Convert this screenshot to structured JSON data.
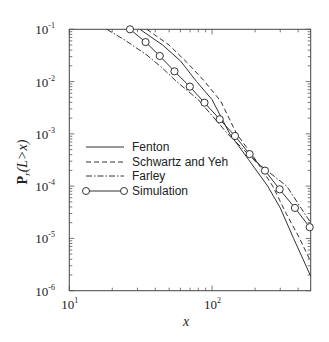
{
  "chart_data": {
    "type": "line",
    "title": "",
    "xlabel": "x",
    "ylabel": "P_r(L>x)",
    "xscale": "log",
    "yscale": "log",
    "xlim": [
      10,
      490
    ],
    "ylim": [
      1e-06,
      0.1
    ],
    "grid": false,
    "legend_position": "center-left",
    "x_tick_labels": [
      {
        "value": 10,
        "base": "10",
        "exp": "1"
      },
      {
        "value": 100,
        "base": "10",
        "exp": "2"
      }
    ],
    "y_tick_labels": [
      {
        "value": 0.1,
        "base": "10",
        "exp": "-1"
      },
      {
        "value": 0.01,
        "base": "10",
        "exp": "-2"
      },
      {
        "value": 0.001,
        "base": "10",
        "exp": "-3"
      },
      {
        "value": 0.0001,
        "base": "10",
        "exp": "-4"
      },
      {
        "value": 1e-05,
        "base": "10",
        "exp": "-5"
      },
      {
        "value": 1e-06,
        "base": "10",
        "exp": "-6"
      }
    ],
    "series": [
      {
        "name": "Fenton",
        "style": "solid",
        "markers": false,
        "x": [
          31.2,
          45,
          60,
          77.8,
          100,
          133,
          180,
          245,
          300,
          372,
          490
        ],
        "y": [
          0.1,
          0.05,
          0.025,
          0.01,
          0.0045,
          0.001,
          0.00032,
          0.0001,
          3.8e-05,
          1e-05,
          1.9e-06
        ]
      },
      {
        "name": "Schwartz and Yeh",
        "style": "dashed",
        "markers": false,
        "x": [
          34.9,
          50,
          68,
          88.9,
          115,
          148.6,
          200,
          265.5,
          330,
          410,
          490
        ],
        "y": [
          0.1,
          0.05,
          0.022,
          0.01,
          0.0042,
          0.001,
          0.00033,
          0.0001,
          3e-05,
          1e-05,
          3.6e-06
        ]
      },
      {
        "name": "Farley",
        "style": "dashdot",
        "markers": false,
        "x": [
          18.3,
          25,
          35,
          45,
          56.4,
          80,
          128.8,
          200,
          332.6,
          420,
          490
        ],
        "y": [
          0.1,
          0.06,
          0.032,
          0.018,
          0.01,
          0.0045,
          0.001,
          0.0003,
          0.0001,
          3.8e-05,
          2e-05
        ]
      },
      {
        "name": "Simulation",
        "style": "solid",
        "markers": true,
        "marker": "open-circle",
        "x": [
          26.6,
          34.2,
          43.0,
          54.5,
          69.8,
          88.4,
          113,
          144.5,
          183,
          234.5,
          297,
          380,
          482
        ],
        "y": [
          0.1,
          0.057,
          0.0309,
          0.0157,
          0.008,
          0.00395,
          0.0019,
          0.00091,
          0.00041,
          0.000198,
          8.7e-05,
          3.83e-05,
          1.64e-05
        ]
      }
    ]
  },
  "legend": {
    "items": [
      {
        "label": "Fenton"
      },
      {
        "label": "Schwartz and Yeh"
      },
      {
        "label": "Farley"
      },
      {
        "label": "Simulation"
      }
    ]
  },
  "axes": {
    "xlabel": "x",
    "ylabel_main": "P",
    "ylabel_sub": "r",
    "ylabel_rest": "(L>x)"
  }
}
